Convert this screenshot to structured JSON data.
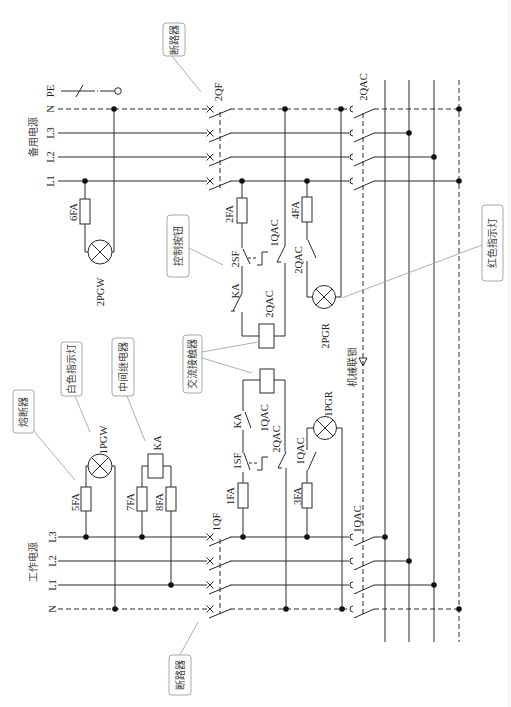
{
  "labels": {
    "backup_power": "备用电源",
    "working_power": "工作电源",
    "mechanical_interlock": "机械联锁",
    "top_lines": {
      "pe": "PE",
      "n": "N",
      "l3": "L3",
      "l2": "L2",
      "l1": "L1"
    },
    "bottom_lines": {
      "l3": "L3",
      "l2": "L2",
      "l1": "L1",
      "n": "N"
    }
  },
  "callouts": {
    "breaker_top": "断路器",
    "control_button": "控制按钮",
    "ac_contactor": "交流接触器",
    "white_lamp": "白色指示灯",
    "intermediate_relay": "中间继电器",
    "fuse": "熔断器",
    "red_lamp": "红色指示灯",
    "breaker_bottom": "断路器"
  },
  "components": {
    "backup_breaker": "2QF",
    "working_breaker": "1QF",
    "backup_main_contactor": "2QAC",
    "working_main_contactor": "1QAC",
    "fuse_6": "6FA",
    "lamp_2pgw": "2PGW",
    "fuse_2": "2FA",
    "button_2sf": "2SF",
    "contact_1qac_nc": "1QAC",
    "contact_ka_top": "KA",
    "coil_2qac": "2QAC",
    "fuse_4": "4FA",
    "contact_2qac_lamp": "2QAC",
    "lamp_2pgr": "2PGR",
    "fuse_5": "5FA",
    "lamp_1pgw": "1PGW",
    "relay_ka": "KA",
    "fuse_7": "7FA",
    "fuse_8": "8FA",
    "fuse_1": "1FA",
    "button_1sf": "1SF",
    "contact_ka_bottom": "KA",
    "coil_1qac": "1QAC",
    "contact_2qac_nc": "2QAC",
    "fuse_3": "3FA",
    "contact_1qac_lamp": "1QAC",
    "lamp_1pgr": "1PGR"
  }
}
